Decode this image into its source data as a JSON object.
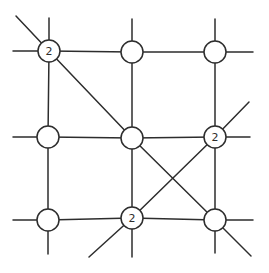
{
  "figure": {
    "width": 269,
    "height": 273,
    "background_color": "#ffffff",
    "line_color": "#2d2d2d",
    "node_fill_color": "#ffffff",
    "node_radius": 11,
    "line_width": 1.5,
    "label_font_size": 11
  },
  "diagram": {
    "nodes": [
      {
        "id": "top-left",
        "x": 49,
        "y": 51,
        "label": "2"
      },
      {
        "id": "top-middle",
        "x": 132,
        "y": 52,
        "label": ""
      },
      {
        "id": "top-right",
        "x": 215,
        "y": 52,
        "label": ""
      },
      {
        "id": "middle-left",
        "x": 48,
        "y": 137,
        "label": ""
      },
      {
        "id": "center",
        "x": 132,
        "y": 138,
        "label": ""
      },
      {
        "id": "middle-right",
        "x": 215,
        "y": 137,
        "label": "2"
      },
      {
        "id": "bottom-left",
        "x": 48,
        "y": 220,
        "label": ""
      },
      {
        "id": "bottom-middle",
        "x": 132,
        "y": 218,
        "label": "2"
      },
      {
        "id": "bottom-right",
        "x": 215,
        "y": 220,
        "label": ""
      }
    ],
    "edges": [
      {
        "from": "top-left",
        "to": "top-middle"
      },
      {
        "from": "top-middle",
        "to": "top-right"
      },
      {
        "from": "middle-left",
        "to": "center"
      },
      {
        "from": "center",
        "to": "middle-right"
      },
      {
        "from": "bottom-left",
        "to": "bottom-middle"
      },
      {
        "from": "bottom-middle",
        "to": "bottom-right"
      },
      {
        "from": "top-left",
        "to": "middle-left"
      },
      {
        "from": "middle-left",
        "to": "bottom-left"
      },
      {
        "from": "top-middle",
        "to": "center"
      },
      {
        "from": "center",
        "to": "bottom-middle"
      },
      {
        "from": "top-right",
        "to": "middle-right"
      },
      {
        "from": "middle-right",
        "to": "bottom-right"
      },
      {
        "from": "top-left",
        "to": "center"
      },
      {
        "from": "center",
        "to": "bottom-right"
      },
      {
        "from": "middle-right",
        "to": "bottom-middle"
      }
    ],
    "stubs": [
      {
        "from": "top-left",
        "dir": "up",
        "x": 49,
        "y": 18
      },
      {
        "from": "top-left",
        "dir": "up-left",
        "x": 16,
        "y": 16
      },
      {
        "from": "top-left",
        "dir": "left",
        "x": 13,
        "y": 51
      },
      {
        "from": "top-middle",
        "dir": "up",
        "x": 132,
        "y": 19
      },
      {
        "from": "top-right",
        "dir": "up",
        "x": 215,
        "y": 19
      },
      {
        "from": "top-right",
        "dir": "right",
        "x": 253,
        "y": 52
      },
      {
        "from": "middle-left",
        "dir": "left",
        "x": 13,
        "y": 137
      },
      {
        "from": "middle-right",
        "dir": "right",
        "x": 250,
        "y": 137
      },
      {
        "from": "middle-right",
        "dir": "up-right",
        "x": 249,
        "y": 102
      },
      {
        "from": "bottom-left",
        "dir": "left",
        "x": 13,
        "y": 220
      },
      {
        "from": "bottom-left",
        "dir": "down",
        "x": 48,
        "y": 254
      },
      {
        "from": "bottom-middle",
        "dir": "down",
        "x": 132,
        "y": 257
      },
      {
        "from": "bottom-middle",
        "dir": "down-left",
        "x": 89,
        "y": 257
      },
      {
        "from": "bottom-right",
        "dir": "right",
        "x": 253,
        "y": 220
      },
      {
        "from": "bottom-right",
        "dir": "down",
        "x": 215,
        "y": 253
      },
      {
        "from": "bottom-right",
        "dir": "down-right",
        "x": 251,
        "y": 256
      }
    ]
  }
}
